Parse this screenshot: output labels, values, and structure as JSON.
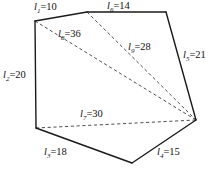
{
  "figure": {
    "caption": "",
    "polygon": {
      "vertices": [
        {
          "name": "A",
          "x": 35,
          "y": 21
        },
        {
          "name": "B",
          "x": 87,
          "y": 12
        },
        {
          "name": "C",
          "x": 166,
          "y": 12
        },
        {
          "name": "D",
          "x": 196,
          "y": 120
        },
        {
          "name": "E",
          "x": 132,
          "y": 163
        },
        {
          "name": "F",
          "x": 36,
          "y": 128
        }
      ]
    },
    "edges": [
      {
        "id": "l1",
        "symbol": "l",
        "subscript": "1",
        "value": 10,
        "text": "l₁=10",
        "from": "A",
        "to": "B"
      },
      {
        "id": "l6",
        "symbol": "l",
        "subscript": "6",
        "value": 14,
        "text": "l₆=14",
        "from": "B",
        "to": "C"
      },
      {
        "id": "l5",
        "symbol": "l",
        "subscript": "5",
        "value": 21,
        "text": "l₅=21",
        "from": "C",
        "to": "D"
      },
      {
        "id": "l4",
        "symbol": "l",
        "subscript": "4",
        "value": 15,
        "text": "l₄=15",
        "from": "D",
        "to": "E"
      },
      {
        "id": "l3",
        "symbol": "l",
        "subscript": "3",
        "value": 18,
        "text": "l₃=18",
        "from": "E",
        "to": "F"
      },
      {
        "id": "l2",
        "symbol": "l",
        "subscript": "2",
        "value": 20,
        "text": "l₂=20",
        "from": "F",
        "to": "A"
      }
    ],
    "diagonals": [
      {
        "id": "l8",
        "symbol": "l",
        "subscript": "8",
        "value": 36,
        "text": "l₈=36",
        "from": "A",
        "to": "D"
      },
      {
        "id": "l9",
        "symbol": "l",
        "subscript": "9",
        "value": 28,
        "text": "l₉=28",
        "from": "B",
        "to": "D"
      },
      {
        "id": "l7",
        "symbol": "l",
        "subscript": "7",
        "value": 30,
        "text": "l₇=30",
        "from": "F",
        "to": "D"
      }
    ],
    "labels": {
      "l1": {
        "sym": "l",
        "sub": "1",
        "eq": "=10"
      },
      "l2": {
        "sym": "l",
        "sub": "2",
        "eq": "=20"
      },
      "l3": {
        "sym": "l",
        "sub": "3",
        "eq": "=18"
      },
      "l4": {
        "sym": "l",
        "sub": "4",
        "eq": "=15"
      },
      "l5": {
        "sym": "l",
        "sub": "5",
        "eq": "=21"
      },
      "l6": {
        "sym": "l",
        "sub": "6",
        "eq": "=14"
      },
      "l7": {
        "sym": "l",
        "sub": "7",
        "eq": "=30"
      },
      "l8": {
        "sym": "l",
        "sub": "8",
        "eq": "=36"
      },
      "l9": {
        "sym": "l",
        "sub": "9",
        "eq": "=28"
      }
    },
    "colors": {
      "edge": "#1a1a1a",
      "diagonal": "#3a3a3a",
      "background": "#ffffff",
      "text": "#111111"
    }
  }
}
